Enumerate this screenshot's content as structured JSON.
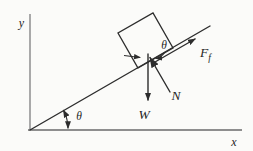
{
  "figure": {
    "type": "free-body-diagram",
    "axes": {
      "x_label": "x",
      "y_label": "y"
    },
    "incline": {
      "angle_label": "θ"
    },
    "apex": {
      "angle_label": "θ"
    },
    "forces": {
      "weight_label": "W",
      "normal_label": "N",
      "friction_label_main": "F",
      "friction_label_sub": "f"
    }
  },
  "colors": {
    "ink": "#2d2d2d",
    "axis_gray": "#8e8e8e",
    "paper": "#fbfbf9",
    "text": "#1f1f1f"
  }
}
